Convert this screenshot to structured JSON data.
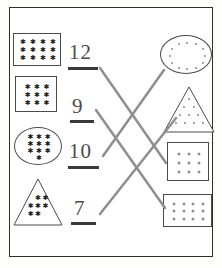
{
  "worksheet": {
    "type": "matching-worksheet",
    "instructions_visible": false,
    "frame_color": "#2e2e2e",
    "line_color": "#8f8f8f",
    "mark_color_left": "#1d1d1d",
    "mark_color_right": "#8a8a8a"
  },
  "left_column": [
    {
      "id": "left-rect-12",
      "shape": "rectangle",
      "mark": "star",
      "count": 12,
      "rows": 3,
      "cols": 4,
      "x": 13,
      "y": 33,
      "w": 48,
      "h": 33
    },
    {
      "id": "left-rect-9",
      "shape": "rectangle",
      "mark": "star",
      "count": 9,
      "rows": 3,
      "cols": 3,
      "x": 15,
      "y": 76,
      "w": 42,
      "h": 36
    },
    {
      "id": "left-ellipse-10",
      "shape": "ellipse",
      "mark": "star",
      "count": 10,
      "rows": 4,
      "cols": 3,
      "x": 14,
      "y": 127,
      "w": 48,
      "h": 38
    },
    {
      "id": "left-triangle-7",
      "shape": "triangle",
      "mark": "star",
      "count": 7,
      "rows": 3,
      "cols": 3,
      "x": 13,
      "y": 178,
      "w": 50,
      "h": 48
    }
  ],
  "numerals": [
    {
      "id": "numeral-12",
      "value": "12",
      "x": 69,
      "y": 42,
      "rule_x": 68,
      "rule_y": 67,
      "rule_w": 30
    },
    {
      "id": "numeral-9",
      "value": "9",
      "x": 72,
      "y": 96,
      "rule_x": 70,
      "rule_y": 120,
      "rule_w": 24
    },
    {
      "id": "numeral-10",
      "value": "10",
      "x": 69,
      "y": 141,
      "rule_x": 68,
      "rule_y": 166,
      "rule_w": 31
    },
    {
      "id": "numeral-7",
      "value": "7",
      "x": 74,
      "y": 198,
      "rule_x": 71,
      "rule_y": 222,
      "rule_w": 25
    }
  ],
  "right_column": [
    {
      "id": "right-ellipse-12",
      "shape": "ellipse",
      "mark": "dot",
      "count": 12,
      "arrangement": "ring",
      "x": 160,
      "y": 35,
      "w": 52,
      "h": 39
    },
    {
      "id": "right-triangle-10",
      "shape": "triangle",
      "mark": "dot",
      "count": 10,
      "arrangement": "triangular",
      "rows": [
        1,
        2,
        3,
        4
      ],
      "x": 163,
      "y": 86,
      "w": 52,
      "h": 47
    },
    {
      "id": "right-rect-9",
      "shape": "rectangle",
      "mark": "dot",
      "count": 9,
      "rows": 3,
      "cols": 3,
      "x": 167,
      "y": 142,
      "w": 42,
      "h": 39
    },
    {
      "id": "right-rect-12",
      "shape": "rectangle",
      "mark": "dot",
      "count": 12,
      "rows": 3,
      "cols": 4,
      "x": 163,
      "y": 194,
      "w": 49,
      "h": 33
    }
  ],
  "connector_lines": [
    {
      "id": "line-12-to-rect9",
      "from": "numeral-12",
      "to": "right-rect-9",
      "x1": 100,
      "y1": 68,
      "x2": 166,
      "y2": 163
    },
    {
      "id": "line-9-to-rect12",
      "from": "numeral-9",
      "to": "right-rect-12",
      "x1": 96,
      "y1": 110,
      "x2": 165,
      "y2": 208
    },
    {
      "id": "line-10-to-ellipse12",
      "from": "numeral-10",
      "to": "right-ellipse-12",
      "x1": 103,
      "y1": 156,
      "x2": 164,
      "y2": 70
    },
    {
      "id": "line-7-to-triangle10",
      "from": "numeral-7",
      "to": "right-triangle-10",
      "x1": 100,
      "y1": 214,
      "x2": 176,
      "y2": 118
    }
  ]
}
